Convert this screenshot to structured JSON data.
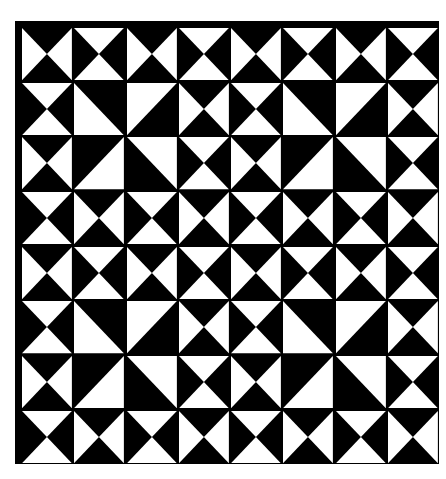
{
  "artwork": {
    "title": "Hourglass and half-square triangle quilt pattern",
    "grid": {
      "rows": 8,
      "cols": 8
    },
    "colors": {
      "dark": "#000000",
      "light": "#ffffff"
    },
    "tile_legend": {
      "LR": "hourglass, left and right triangles white",
      "TB": "hourglass, top and bottom triangles white",
      "BL": "half-square, bottom-left white",
      "TL": "half-square, top-left white",
      "BR": "half-square, bottom-right white",
      "TR": "half-square, top-right white"
    },
    "cells": [
      [
        "LR",
        "TB",
        "LR",
        "TB",
        "LR",
        "TB",
        "LR",
        "TB"
      ],
      [
        "TB",
        "BL",
        "TL",
        "LR",
        "TB",
        "BL",
        "TL",
        "LR"
      ],
      [
        "LR",
        "BR",
        "TR",
        "TB",
        "LR",
        "BR",
        "TR",
        "TB"
      ],
      [
        "TB",
        "LR",
        "TB",
        "LR",
        "TB",
        "LR",
        "TB",
        "LR"
      ],
      [
        "LR",
        "TB",
        "LR",
        "TB",
        "LR",
        "TB",
        "LR",
        "TB"
      ],
      [
        "TB",
        "BL",
        "TL",
        "LR",
        "TB",
        "BL",
        "TL",
        "LR"
      ],
      [
        "LR",
        "BR",
        "TR",
        "TB",
        "LR",
        "BR",
        "TR",
        "TB"
      ],
      [
        "TB",
        "LR",
        "TB",
        "LR",
        "TB",
        "LR",
        "TB",
        "LR"
      ]
    ]
  }
}
